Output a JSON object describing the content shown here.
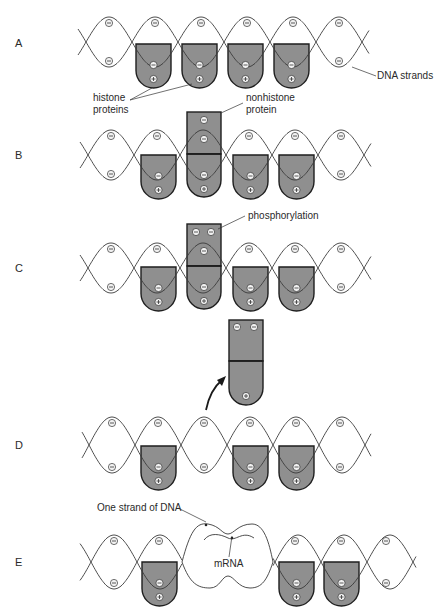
{
  "figure": {
    "type": "diagram",
    "colors": {
      "protein_fill": "#8f8f8f",
      "outline": "#1e1e1e",
      "strand": "#3a3a3a",
      "background": "#ffffff"
    }
  },
  "panels": [
    {
      "id": "A",
      "label": "A",
      "center_y": 42,
      "amp": 25,
      "x_start": 78,
      "x_end": 369,
      "phase_x": 86,
      "histones_x": [
        136,
        182,
        228,
        274
      ],
      "histone_top": 44,
      "top_minus_x": [
        109,
        155,
        201,
        247,
        293,
        339
      ],
      "bottom_minus_x": [
        109,
        339
      ]
    },
    {
      "id": "B",
      "label": "B",
      "center_y": 155,
      "amp": 25,
      "x_start": 80,
      "x_end": 371,
      "phase_x": 88,
      "histones_x": [
        141,
        233,
        279
      ],
      "histone_top": 155,
      "top_minus_x": [
        111,
        157,
        249,
        295,
        341
      ],
      "bottom_minus_x": [
        111,
        341
      ],
      "nonhistone": {
        "x": 187,
        "top": 112,
        "divider": 154,
        "minus_count_top": 1
      }
    },
    {
      "id": "C",
      "label": "C",
      "center_y": 268,
      "amp": 25,
      "x_start": 80,
      "x_end": 371,
      "phase_x": 88,
      "histones_x": [
        141,
        233,
        279
      ],
      "histone_top": 267,
      "top_minus_x": [
        111,
        157,
        249,
        295,
        341
      ],
      "bottom_minus_x": [
        111,
        341
      ],
      "nonhistone": {
        "x": 187,
        "top": 224,
        "divider": 266,
        "minus_count_top": 2
      }
    },
    {
      "id": "D",
      "label": "D",
      "center_y": 445,
      "amp": 28,
      "x_start": 82,
      "x_end": 371,
      "phase_x": 89,
      "histones_x": [
        141,
        233,
        279
      ],
      "histone_top": 446,
      "top_minus_x": [
        112,
        158,
        204,
        250,
        296,
        340
      ],
      "bottom_minus_x": [
        112,
        204,
        340
      ],
      "detached": {
        "x": 229,
        "top": 320,
        "divider": 361
      }
    },
    {
      "id": "E",
      "label": "E",
      "center_y": 562,
      "amp": 27,
      "x_start": 80,
      "x_end": 416,
      "phase_x": 91,
      "histones_x": [
        142,
        279,
        324
      ],
      "histone_top": 562,
      "top_minus_x": [
        114,
        159,
        295,
        341,
        386
      ],
      "bottom_minus_x": [
        114,
        386
      ],
      "bubble": {
        "x_from": 182,
        "x_to": 273
      }
    }
  ],
  "labels": {
    "panel_A": "A",
    "panel_B": "B",
    "panel_C": "C",
    "panel_D": "D",
    "panel_E": "E",
    "dna_strands": "DNA strands",
    "histone_line1": "histone",
    "histone_line2": "proteins",
    "nonhistone_line1": "nonhistone",
    "nonhistone_line2": "protein",
    "phosphorylation": "phosphorylation",
    "one_strand": "One strand of DNA",
    "mrna": "mRNA"
  }
}
